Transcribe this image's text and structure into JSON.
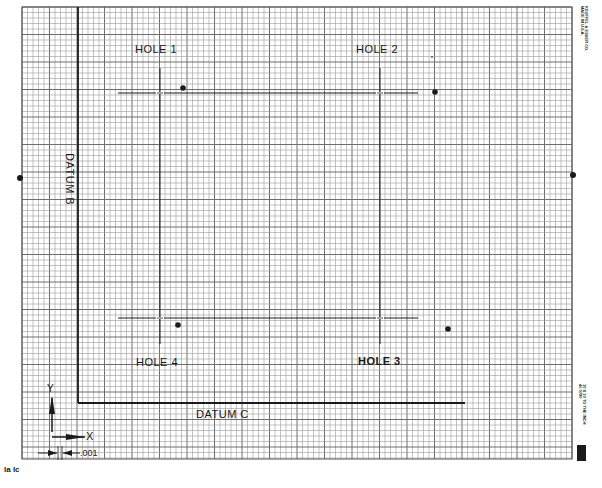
{
  "sheet": {
    "type": "graph-paper hole-location diagram",
    "paper_color": "#ffffff",
    "grid_color": "#9a9a9a",
    "grid_major_color": "#6e6e6e",
    "ink_color": "#1a1a1a",
    "grid": {
      "left": 22,
      "top": 7,
      "right": 572,
      "bottom": 459,
      "cell": 5.5,
      "major_every": 5
    }
  },
  "datums": {
    "b": {
      "label": "DATUM B",
      "x": 78,
      "y1": 7,
      "y2": 403
    },
    "c": {
      "label": "DATUM C",
      "y": 403,
      "x1": 78,
      "x2": 465
    }
  },
  "holes": [
    {
      "label": "HOLE 1",
      "cx": 160,
      "cy": 93,
      "dot": {
        "x": 183,
        "y": 88
      }
    },
    {
      "label": "HOLE 2",
      "cx": 380,
      "cy": 93,
      "dot": {
        "x": 435,
        "y": 92
      }
    },
    {
      "label": "HOLE 3",
      "cx": 380,
      "cy": 318,
      "dot": {
        "x": 448,
        "y": 329
      }
    },
    {
      "label": "HOLE 4",
      "cx": 160,
      "cy": 318,
      "dot": {
        "x": 178,
        "y": 325
      }
    }
  ],
  "reference_dots": [
    {
      "x": 20,
      "y": 178
    },
    {
      "x": 573,
      "y": 175
    }
  ],
  "axis_key": {
    "x_label": "X",
    "y_label": "Y",
    "scale_label": ".001"
  },
  "vendor_text": {
    "top_right": [
      "KEUFFEL & ESSER CO.",
      "MADE IN U.S.A."
    ],
    "bottom_right": [
      "10 X 10 TO THE INCH",
      "46 0780"
    ]
  },
  "footer": {
    "left_marks": "la  lc"
  }
}
